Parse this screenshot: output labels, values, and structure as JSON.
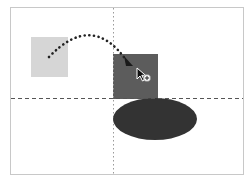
{
  "diagram": {
    "type": "drag-and-drop illustration",
    "frame": {
      "x": 10,
      "y": 7,
      "width": 233,
      "height": 167,
      "stroke": "#c8c8c8"
    },
    "guides": {
      "vertical": {
        "x": 113,
        "y1": 7,
        "y2": 174,
        "style": "dotted",
        "color": "#9a9a9a"
      },
      "horizontal": {
        "y": 98,
        "x1": 10,
        "x2": 243,
        "style": "dashed",
        "color": "#555555"
      }
    },
    "shapes": {
      "source_square": {
        "x": 31,
        "y": 37,
        "width": 37,
        "height": 40,
        "fill": "#d6d6d6"
      },
      "target_square": {
        "x": 113,
        "y": 54,
        "width": 45,
        "height": 45,
        "fill": "#5c5c5c"
      },
      "ellipse": {
        "cx": 155,
        "cy": 119,
        "rx": 42,
        "ry": 21,
        "fill": "#333333"
      }
    },
    "drag_path": {
      "style": "dotted",
      "color": "#222222",
      "start": [
        49,
        57
      ],
      "control": [
        92,
        12
      ],
      "end": [
        128,
        64
      ]
    },
    "cursor": {
      "x": 138,
      "y": 68,
      "icon": "arrow-cursor-with-plus"
    }
  }
}
